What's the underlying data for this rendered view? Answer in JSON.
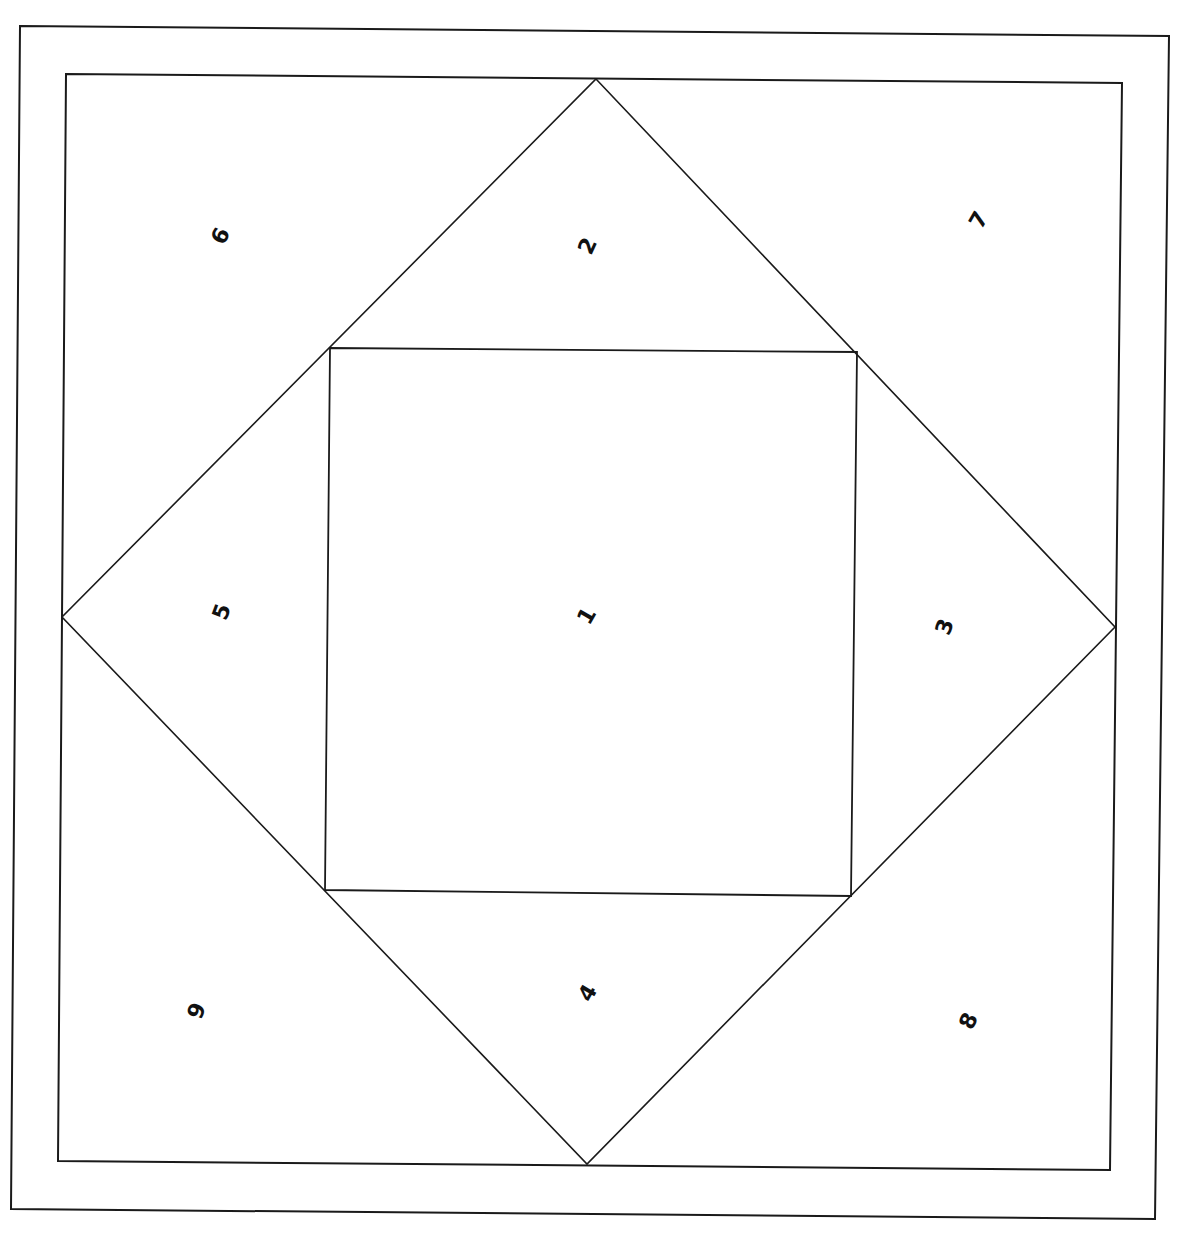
{
  "diagram": {
    "stroke_color": "#1a1a1a",
    "background": "#ffffff",
    "outer_border": [
      [
        20,
        26
      ],
      [
        1169,
        36
      ],
      [
        1155,
        1219
      ],
      [
        11,
        1209
      ]
    ],
    "inner_border": [
      [
        66,
        74
      ],
      [
        1122,
        83
      ],
      [
        1110,
        1170
      ],
      [
        58,
        1161
      ]
    ],
    "diamond": [
      [
        596,
        79
      ],
      [
        1115,
        627
      ],
      [
        587,
        1164
      ],
      [
        62,
        617
      ]
    ],
    "center_square": [
      [
        330,
        348
      ],
      [
        857,
        352
      ],
      [
        851,
        896
      ],
      [
        325,
        890
      ]
    ],
    "pieces": [
      {
        "label": "1",
        "x": 587,
        "y": 616,
        "rotate": -60
      },
      {
        "label": "2",
        "x": 588,
        "y": 246,
        "rotate": -65
      },
      {
        "label": "3",
        "x": 945,
        "y": 627,
        "rotate": -70
      },
      {
        "label": "4",
        "x": 588,
        "y": 993,
        "rotate": -60
      },
      {
        "label": "5",
        "x": 222,
        "y": 612,
        "rotate": -70
      },
      {
        "label": "6",
        "x": 221,
        "y": 236,
        "rotate": -65
      },
      {
        "label": "7",
        "x": 979,
        "y": 220,
        "rotate": -60
      },
      {
        "label": "8",
        "x": 969,
        "y": 1021,
        "rotate": -65
      },
      {
        "label": "9",
        "x": 197,
        "y": 1011,
        "rotate": -70
      }
    ]
  }
}
